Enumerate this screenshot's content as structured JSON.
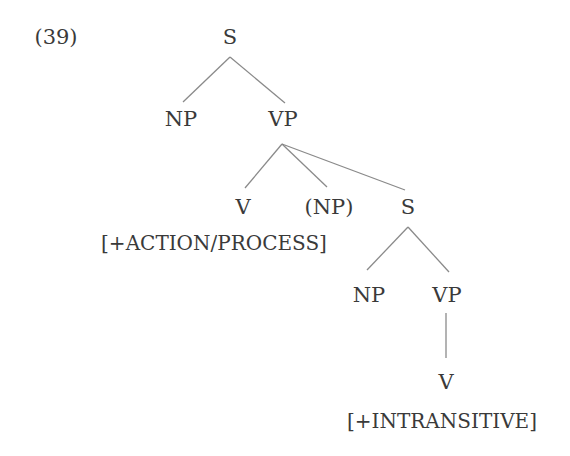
{
  "example_number": "(39)",
  "tree": {
    "root": "S",
    "np1": "NP",
    "vp1": "VP",
    "v1": "V",
    "np_optional": "(NP)",
    "s2": "S",
    "v1_feature": "[+ACTION/PROCESS]",
    "np2": "NP",
    "vp2": "VP",
    "v2": "V",
    "v2_feature": "[+INTRANSITIVE]"
  },
  "colors": {
    "text": "#3a3a3a",
    "lines": "#8a8a8a",
    "background": "#ffffff"
  }
}
